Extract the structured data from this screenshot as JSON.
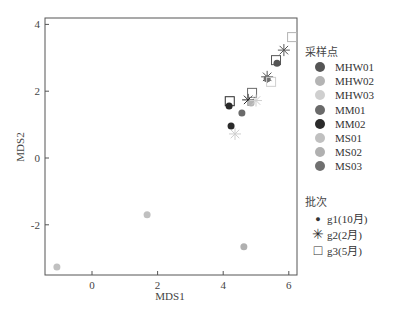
{
  "chart_data": {
    "type": "scatter",
    "title": "",
    "xlabel": "MDS1",
    "ylabel": "MDS2",
    "xlim": [
      -1.4,
      6.4
    ],
    "ylim": [
      -3.5,
      4.05
    ],
    "xticks": [
      0,
      2,
      4,
      6
    ],
    "yticks": [
      -2,
      0,
      2,
      4
    ],
    "grid": false,
    "legend_position": "right",
    "color_legend": {
      "title": "采样点",
      "entries": [
        {
          "name": "MHW01",
          "color": "#555555"
        },
        {
          "name": "MHW02",
          "color": "#b4b4b4"
        },
        {
          "name": "MHW03",
          "color": "#cfcfcf"
        },
        {
          "name": "MM01",
          "color": "#6a6a6a"
        },
        {
          "name": "MM02",
          "color": "#2a2a2a"
        },
        {
          "name": "MS01",
          "color": "#c0c0c0"
        },
        {
          "name": "MS02",
          "color": "#b0b0b0"
        },
        {
          "name": "MS03",
          "color": "#707070"
        }
      ]
    },
    "shape_legend": {
      "title": "批次",
      "entries": [
        {
          "name": "g1(10月)",
          "shape": "circle"
        },
        {
          "name": "g2(2月)",
          "shape": "star"
        },
        {
          "name": "g3(5月)",
          "shape": "square"
        }
      ]
    },
    "points": [
      {
        "x": -1.07,
        "y": -3.26,
        "site": "MS01",
        "batch": "g1(10月)"
      },
      {
        "x": 1.68,
        "y": -1.7,
        "site": "MS01",
        "batch": "g1(10月)"
      },
      {
        "x": 4.63,
        "y": -2.66,
        "site": "MS02",
        "batch": "g1(10月)"
      },
      {
        "x": 4.18,
        "y": 1.56,
        "site": "MM02",
        "batch": "g1(10月)"
      },
      {
        "x": 4.2,
        "y": 1.7,
        "site": "MM02",
        "batch": "g3(5月)"
      },
      {
        "x": 4.57,
        "y": 1.35,
        "site": "MM01",
        "batch": "g1(10月)"
      },
      {
        "x": 4.24,
        "y": 0.96,
        "site": "MM02",
        "batch": "g1(10月)"
      },
      {
        "x": 4.36,
        "y": 0.72,
        "site": "MHW03",
        "batch": "g2(2月)"
      },
      {
        "x": 4.76,
        "y": 1.74,
        "site": "MM02",
        "batch": "g2(2月)"
      },
      {
        "x": 4.88,
        "y": 1.95,
        "site": "MM01",
        "batch": "g3(5月)"
      },
      {
        "x": 4.85,
        "y": 1.65,
        "site": "MHW02",
        "batch": "g1(10月)"
      },
      {
        "x": 5.0,
        "y": 1.72,
        "site": "MHW03",
        "batch": "g2(2月)"
      },
      {
        "x": 5.34,
        "y": 2.43,
        "site": "MHW01",
        "batch": "g2(2月)"
      },
      {
        "x": 5.34,
        "y": 2.37,
        "site": "MS03",
        "batch": "g1(10月)"
      },
      {
        "x": 5.46,
        "y": 2.28,
        "site": "MHW03",
        "batch": "g3(5月)"
      },
      {
        "x": 5.64,
        "y": 2.84,
        "site": "MHW01",
        "batch": "g1(10月)"
      },
      {
        "x": 5.61,
        "y": 2.93,
        "site": "MHW01",
        "batch": "g3(5月)"
      },
      {
        "x": 5.85,
        "y": 3.23,
        "site": "MHW01",
        "batch": "g2(2月)"
      },
      {
        "x": 6.1,
        "y": 3.62,
        "site": "MHW02",
        "batch": "g3(5月)"
      }
    ]
  },
  "legend": {
    "site_title": "采样点",
    "sites": [
      {
        "label": "MHW01",
        "color": "#555555"
      },
      {
        "label": "MHW02",
        "color": "#b4b4b4"
      },
      {
        "label": "MHW03",
        "color": "#cfcfcf"
      },
      {
        "label": "MM01",
        "color": "#6a6a6a"
      },
      {
        "label": "MM02",
        "color": "#2a2a2a"
      },
      {
        "label": "MS01",
        "color": "#c0c0c0"
      },
      {
        "label": "MS02",
        "color": "#b0b0b0"
      },
      {
        "label": "MS03",
        "color": "#707070"
      }
    ],
    "batch_title": "批次",
    "batches": [
      {
        "label": "g1(10月)",
        "symbol": "●"
      },
      {
        "label": "g2(2月)",
        "symbol": "✳"
      },
      {
        "label": "g3(5月)",
        "symbol": "□"
      }
    ]
  }
}
